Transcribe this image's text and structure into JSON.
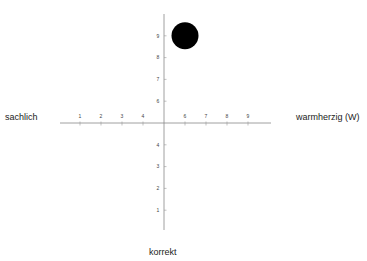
{
  "labels": {
    "left": "sachlich",
    "right": "warmherzig (W)",
    "bottom": "korrekt"
  },
  "colors": {
    "axis": "#888888",
    "marker": "#000000",
    "text": "#222222"
  },
  "chart_data": {
    "type": "scatter",
    "title": "",
    "xlabel_left": "sachlich",
    "xlabel_right": "warmherzig (W)",
    "ylabel_bottom": "korrekt",
    "x_ticks": [
      1,
      2,
      3,
      4,
      6,
      7,
      8,
      9
    ],
    "y_ticks": [
      1,
      2,
      3,
      4,
      6,
      7,
      8,
      9
    ],
    "xlim": [
      0,
      10
    ],
    "ylim": [
      0,
      10
    ],
    "origin": [
      5,
      5
    ],
    "grid": false,
    "points": [
      {
        "x": 6,
        "y": 9,
        "size": "large"
      }
    ]
  }
}
